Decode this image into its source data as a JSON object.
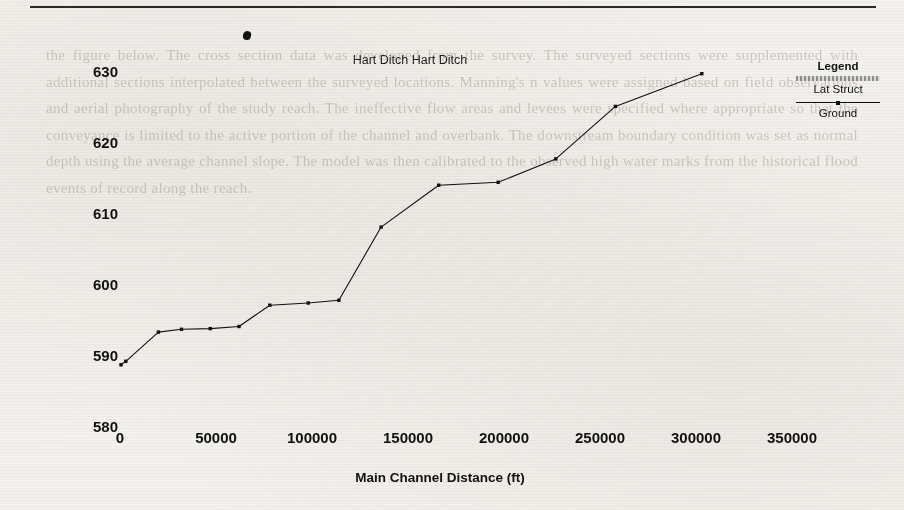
{
  "page": {
    "background_color": "#f4f2ee",
    "ink_color": "#111111",
    "bleed_text": "the figure below. The cross section data was developed from the survey. The surveyed sections were supplemented with additional sections interpolated between the surveyed locations. Manning's n values were assigned based on field observations and aerial photography of the study reach. The ineffective flow areas and levees were specified where appropriate so that the conveyance is limited to the active portion of the channel and overbank. The downstream boundary condition was set as normal depth using the average channel slope. The model was then calibrated to the observed high water marks from the historical flood events of record along the reach."
  },
  "figure": {
    "title": "Hart Ditch Hart Ditch",
    "legend": {
      "title": "Legend",
      "entries": [
        {
          "label": "Lat Struct",
          "style": "hatched-gray-band",
          "color": "#8e8e8e"
        },
        {
          "label": "Ground",
          "style": "line-with-marker",
          "color": "#111111"
        }
      ]
    }
  },
  "chart_data": {
    "type": "line",
    "title": "Hart Ditch Hart Ditch",
    "xlabel": "Main Channel Distance (ft)",
    "ylabel": "Elevation (ft)",
    "xlim": [
      -5000,
      375000
    ],
    "ylim": [
      578,
      634
    ],
    "xticks": [
      0,
      50000,
      100000,
      150000,
      200000,
      250000,
      300000,
      350000
    ],
    "yticks": [
      580,
      590,
      600,
      610,
      620,
      630
    ],
    "grid": false,
    "legend_position": "right",
    "series": [
      {
        "name": "Ground",
        "color": "#111111",
        "marker": "square",
        "x": [
          500,
          3000,
          20000,
          32000,
          47000,
          62000,
          78000,
          98000,
          114000,
          136000,
          166000,
          197000,
          227000,
          258000,
          303000
        ],
        "y": [
          588.9,
          589.4,
          593.5,
          593.9,
          594.0,
          594.3,
          597.3,
          597.6,
          598.0,
          608.3,
          614.2,
          614.6,
          617.9,
          625.3,
          629.9
        ]
      }
    ]
  }
}
